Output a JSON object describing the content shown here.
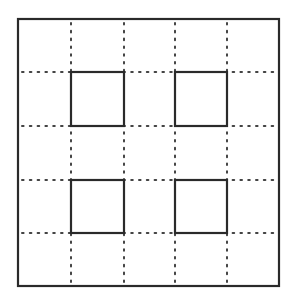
{
  "diagram": {
    "title": "",
    "grid": {
      "rows": 5,
      "cols": 5,
      "x_lines": [
        18,
        71,
        124,
        175,
        227,
        279
      ],
      "y_lines": [
        19,
        72,
        126,
        180,
        233,
        286
      ],
      "line_color": "#2a2a2a",
      "dot_color": "#444444"
    },
    "bold_squares": [
      {
        "row": 1,
        "col": 1
      },
      {
        "row": 1,
        "col": 3
      },
      {
        "row": 3,
        "col": 1
      },
      {
        "row": 3,
        "col": 3
      }
    ]
  }
}
